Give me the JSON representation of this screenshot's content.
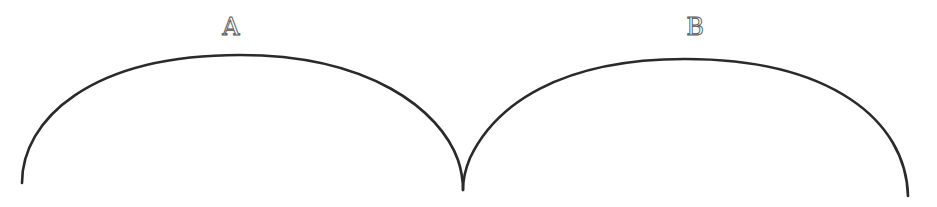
{
  "diagram": {
    "type": "two-arcs-cusp",
    "stroke_color": "#2a2a2a",
    "background": "#ffffff",
    "arcs": [
      {
        "id": "A",
        "label": "A",
        "start": [
          22,
          183
        ],
        "apex": [
          240,
          55
        ],
        "end": [
          463,
          190
        ]
      },
      {
        "id": "B",
        "label": "B",
        "start": [
          463,
          190
        ],
        "apex": [
          685,
          59
        ],
        "end": [
          908,
          196
        ]
      }
    ],
    "labels": {
      "a": "A",
      "b": "B"
    },
    "cusp_point": [
      463,
      190
    ]
  }
}
